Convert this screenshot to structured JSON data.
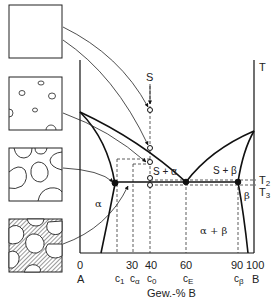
{
  "diagram": {
    "type": "binary-eutectic-phase-diagram",
    "axis": {
      "y_label": "T",
      "x_label": "Gew.-% B",
      "left_component": "A",
      "right_component": "B",
      "ticks": [
        "0",
        "30",
        "40",
        "60",
        "90",
        "100"
      ],
      "composition_marks": [
        {
          "name": "c",
          "sub": "1"
        },
        {
          "name": "c",
          "sub": "α"
        },
        {
          "name": "c",
          "sub": "0"
        },
        {
          "name": "c",
          "sub": "E"
        },
        {
          "name": "c",
          "sub": "β"
        }
      ]
    },
    "temperatures": {
      "t2": {
        "name": "T",
        "sub": "2"
      },
      "t3": {
        "name": "T",
        "sub": "3"
      }
    },
    "regions": {
      "liquid_marker": "S",
      "s_alpha": "S + α",
      "s_beta": "S + β",
      "alpha": "α",
      "beta": "β",
      "alpha_beta": "α + β"
    },
    "microstructures": [
      {
        "name": "liquid",
        "description": "empty square"
      },
      {
        "name": "primary-nuclei",
        "description": "few small circles"
      },
      {
        "name": "primary-alpha-grains",
        "description": "large rounded grains"
      },
      {
        "name": "eutectic",
        "description": "grains with lamellar eutectic"
      }
    ],
    "colors": {
      "line": "#111111",
      "background": "#ffffff"
    }
  }
}
